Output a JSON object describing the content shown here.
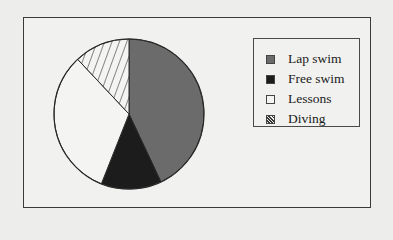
{
  "chart_data": {
    "type": "pie",
    "title": "",
    "categories": [
      "Lap swim",
      "Free swim",
      "Lessons",
      "Diving"
    ],
    "values": [
      43,
      13,
      32,
      12
    ],
    "unit": "%",
    "start_angle": "12 o'clock",
    "direction": "clockwise",
    "fills": [
      "#6b6b6b",
      "#1c1c1c",
      "#f4f4f2",
      "hatched"
    ],
    "legend_position": "right"
  },
  "legend": {
    "items": [
      {
        "label": "Lap swim",
        "color": "#6b6b6b",
        "pattern": "solid"
      },
      {
        "label": "Free swim",
        "color": "#1c1c1c",
        "pattern": "solid"
      },
      {
        "label": "Lessons",
        "color": "#f4f4f2",
        "pattern": "solid"
      },
      {
        "label": "Diving",
        "color": "#f4f4f2",
        "pattern": "diagonal-hatch"
      }
    ]
  }
}
